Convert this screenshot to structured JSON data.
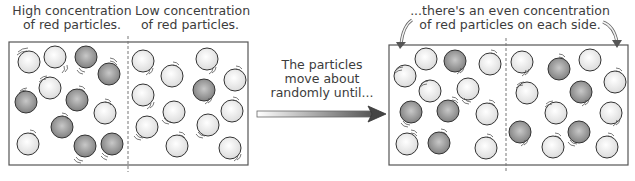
{
  "labels": {
    "high_line1": "High concentration",
    "high_line2": "of red particles.",
    "low_line1": "Low concentration",
    "low_line2": "of red particles.",
    "middle_line1": "The particles",
    "middle_line2": "move about",
    "middle_line3": "randomly until...",
    "even_line1": "...there's an even concentration",
    "even_line2": "of red particles on each side."
  },
  "colors": {
    "light_particle": "#eeeeee",
    "red_particle": "#8c8c8c",
    "outline": "#333333",
    "box_border": "#555555"
  },
  "before": {
    "left_side": {
      "red_count": 8,
      "light_count": 4
    },
    "right_side": {
      "red_count": 1,
      "light_count": 12
    }
  },
  "after": {
    "left_side": {
      "red_count": 5,
      "light_count": 9
    },
    "right_side": {
      "red_count": 5,
      "light_count": 9
    }
  }
}
